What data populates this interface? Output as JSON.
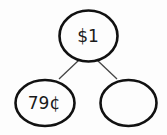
{
  "diagram": {
    "type": "number-bond",
    "whole": {
      "label": "$1"
    },
    "parts": [
      {
        "label": "79¢"
      },
      {
        "label": ""
      }
    ],
    "colors": {
      "stroke": "#111111",
      "connector": "#444444",
      "background": "#fdfdfd",
      "text": "#1a1a1a"
    }
  }
}
